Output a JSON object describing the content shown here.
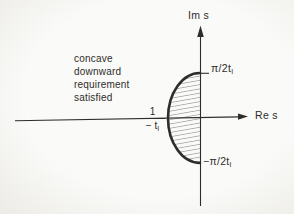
{
  "figure": {
    "colors": {
      "paper": "#fafaf8",
      "edge": "#ecebe7",
      "ink": "#2e2d2b",
      "hatch": "#3c3c3c"
    },
    "annotation": {
      "lines": [
        "concave",
        "downward",
        "requirement",
        "satisfied"
      ]
    },
    "axes": {
      "im_label": "Im s",
      "re_label": "Re s"
    },
    "labels": {
      "top_main": "π/2t",
      "top_sub": "I",
      "bottom_main": "−π/2t",
      "bottom_sub": "I",
      "frac_num": "1",
      "frac_den_main": "− t",
      "frac_den_sub": "I"
    }
  }
}
